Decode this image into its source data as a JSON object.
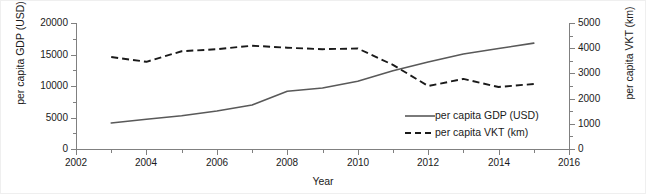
{
  "chart_data": {
    "type": "line",
    "title": "",
    "xlabel": "Year",
    "x": [
      2003,
      2004,
      2005,
      2006,
      2007,
      2008,
      2009,
      2010,
      2011,
      2012,
      2013,
      2014,
      2015
    ],
    "xlim": [
      2002,
      2016
    ],
    "xticks": [
      2002,
      2004,
      2006,
      2008,
      2010,
      2012,
      2014,
      2016
    ],
    "xticklabels": [
      "2002",
      "2004",
      "2006",
      "2008",
      "2010",
      "2012",
      "2014",
      "2016"
    ],
    "grid": false,
    "legend_position": "lower right",
    "axes": [
      {
        "id": "left",
        "label": "per capita GDP (USD)",
        "ylim": [
          0,
          20000
        ],
        "yticks": [
          0,
          5000,
          10000,
          15000,
          20000
        ],
        "yticklabels": [
          "0",
          "5000",
          "10000",
          "15000",
          "20000"
        ]
      },
      {
        "id": "right",
        "label": "per capita VKT (km)",
        "ylim": [
          0,
          5000
        ],
        "yticks": [
          0,
          1000,
          2000,
          3000,
          4000,
          5000
        ],
        "yticklabels": [
          "0",
          "1000",
          "2000",
          "3000",
          "4000",
          "5000"
        ]
      }
    ],
    "series": [
      {
        "name": "per capita GDP (USD)",
        "axis": "left",
        "style": "solid",
        "color": "#595959",
        "values": [
          4130,
          4720,
          5280,
          6020,
          6980,
          9170,
          9680,
          10750,
          12420,
          13810,
          15080,
          15950,
          16800
        ]
      },
      {
        "name": "per capita VKT (km)",
        "axis": "right",
        "style": "dashed",
        "color": "#1a1a1a",
        "values": [
          3650,
          3460,
          3880,
          3960,
          4100,
          4020,
          3960,
          3990,
          3340,
          2500,
          2780,
          2460,
          2580
        ]
      }
    ]
  },
  "legend": {
    "items": [
      {
        "label": "per capita GDP (USD)",
        "style": "solid"
      },
      {
        "label": "per capita VKT (km)",
        "style": "dashed"
      }
    ]
  }
}
